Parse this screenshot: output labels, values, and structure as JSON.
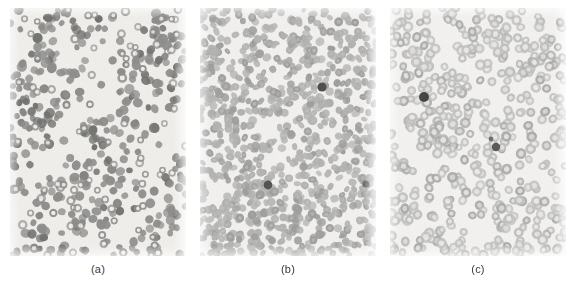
{
  "figure": {
    "title": "",
    "background_color": "#ffffff",
    "width": 578,
    "height": 284
  },
  "panels": [
    {
      "id": "panel-a",
      "caption": "(a)",
      "x": 10,
      "y": 8,
      "width": 176,
      "height": 248,
      "caption_x": 98,
      "caption_y": 262,
      "description": "blood smear micrograph",
      "background_color": "#f2f0ed",
      "cell_color": "#8b8b89",
      "cell_color_dark": "#6e6e6c",
      "ring_color": "#9a9a98",
      "cell_count": 470,
      "ring_count": 95,
      "cell_radius_min": 3.0,
      "cell_radius_max": 5.2,
      "packing": "sparse-clustered",
      "dark_cells": []
    },
    {
      "id": "panel-b",
      "caption": "(b)",
      "x": 200,
      "y": 8,
      "width": 176,
      "height": 248,
      "caption_x": 288,
      "caption_y": 262,
      "description": "blood smear micrograph",
      "background_color": "#f4f3f1",
      "cell_color": "#b2b2b0",
      "cell_color_dark": "#9d9d9b",
      "ring_color": "#c2c2c0",
      "cell_count": 900,
      "ring_count": 0,
      "cell_radius_min": 3.2,
      "cell_radius_max": 4.6,
      "packing": "dense",
      "dark_cells": [
        {
          "x": 122,
          "y": 79,
          "r": 4.6,
          "color": "#4a4a48"
        },
        {
          "x": 68,
          "y": 177,
          "r": 4.4,
          "color": "#4f4f4d"
        },
        {
          "x": 166,
          "y": 176,
          "r": 3.6,
          "color": "#6a6a68"
        }
      ]
    },
    {
      "id": "panel-c",
      "caption": "(c)",
      "x": 390,
      "y": 8,
      "width": 176,
      "height": 248,
      "caption_x": 478,
      "caption_y": 262,
      "description": "blood smear micrograph",
      "background_color": "#f5f4f2",
      "cell_color": "#c0c0be",
      "cell_color_dark": "#ababa9",
      "ring_color": "#d2d2d0",
      "cell_count": 560,
      "ring_count": 560,
      "cell_radius_min": 4.0,
      "cell_radius_max": 5.6,
      "packing": "medium-round",
      "dark_cells": [
        {
          "x": 34,
          "y": 89,
          "r": 5.0,
          "color": "#3f3f3d"
        },
        {
          "x": 106,
          "y": 139,
          "r": 4.2,
          "color": "#55555 3"
        },
        {
          "x": 101,
          "y": 131,
          "r": 2.4,
          "color": "#6d6d6b"
        }
      ]
    }
  ]
}
